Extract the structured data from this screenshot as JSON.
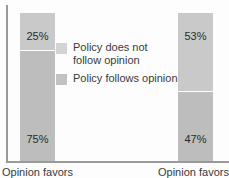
{
  "chart_data": {
    "type": "bar",
    "title": "",
    "subtitle": "",
    "xlabel": "",
    "ylabel": "",
    "ylim": [
      0,
      100
    ],
    "grid": false,
    "stacked": true,
    "legend_position": "center",
    "categories": [
      "Opinion favors",
      "Opinion favors"
    ],
    "series": [
      {
        "name": "Policy does not follow opinion",
        "values": [
          25,
          53
        ],
        "color": "#c9c9c9"
      },
      {
        "name": "Policy follows opinion",
        "values": [
          75,
          47
        ],
        "color": "#bdbdbd"
      }
    ],
    "bars": [
      {
        "category": "Opinion favors",
        "segments": [
          {
            "label": "25%",
            "value": 25,
            "series": "Policy does not follow opinion"
          },
          {
            "label": "75%",
            "value": 75,
            "series": "Policy follows opinion"
          }
        ]
      },
      {
        "category": "Opinion favors",
        "segments": [
          {
            "label": "53%",
            "value": 53,
            "series": "Policy does not follow opinion"
          },
          {
            "label": "47%",
            "value": 47,
            "series": "Policy follows opinion"
          }
        ]
      }
    ]
  },
  "legend": {
    "items": [
      {
        "label": "Policy does not\nfollow opinion",
        "color": "#d4d4d4"
      },
      {
        "label": "Policy follows opinion",
        "color": "#c2c2c2"
      }
    ]
  },
  "axis": {
    "left_category_label": "Opinion favors",
    "right_category_label": "Opinion favors"
  }
}
